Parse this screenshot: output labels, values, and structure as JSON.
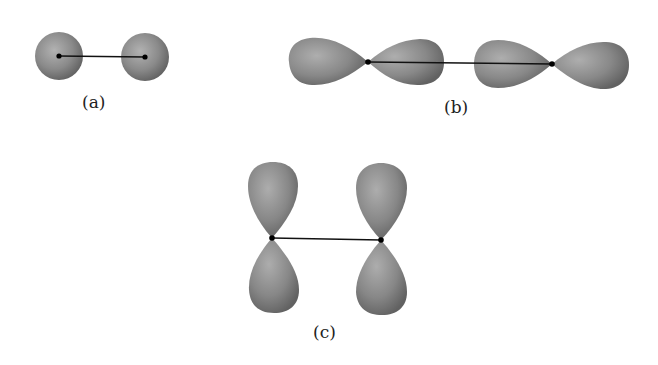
{
  "figure": {
    "colors": {
      "orbital_fill_light": "#a8a8a8",
      "orbital_fill_dark": "#6e6e6e",
      "bond_line": "#111111",
      "nucleus": "#000000",
      "label_text": "#222222"
    },
    "panels": [
      {
        "id": "a",
        "label": "(a)",
        "description": "Two s orbitals overlapping along the internuclear axis"
      },
      {
        "id": "b",
        "label": "(b)",
        "description": "Two p orbitals overlapping end-to-end (sigma)"
      },
      {
        "id": "c",
        "label": "(c)",
        "description": "Two p orbitals overlapping side-by-side (pi)"
      }
    ]
  }
}
